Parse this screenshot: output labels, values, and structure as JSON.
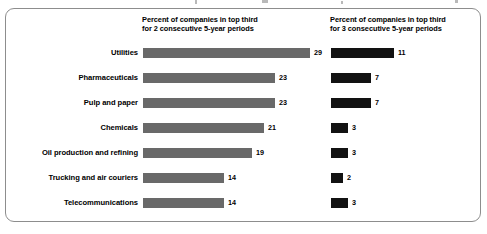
{
  "frame": {
    "border_color": "#8d8d8d",
    "background": "#ffffff"
  },
  "headers": {
    "series_1": "Percent of companies in top third\nfor 2 consecutive 5-year periods",
    "series_2": "Percent of companies in top third\nfor 3 consecutive 5-year periods"
  },
  "chart_data": {
    "type": "bar",
    "orientation": "horizontal",
    "title": "",
    "subtitle": "",
    "xlabel": "",
    "ylabel": "",
    "grid": false,
    "legend_position": "top-as-column-headers",
    "axis_visible": false,
    "categories": [
      "Utilities",
      "Pharmaceuticals",
      "Pulp and paper",
      "Chemicals",
      "Oil production and refining",
      "Trucking and air couriers",
      "Telecommunications"
    ],
    "series": [
      {
        "name": "Percent of companies in top third for 2 consecutive 5-year periods",
        "color": "#696969",
        "values": [
          29,
          23,
          23,
          21,
          19,
          14,
          14
        ]
      },
      {
        "name": "Percent of companies in top third for 3 consecutive 5-year periods",
        "color": "#121212",
        "values": [
          11,
          7,
          7,
          3,
          3,
          2,
          3
        ]
      }
    ],
    "xlim": [
      0,
      29
    ],
    "value_labels_shown": true
  }
}
